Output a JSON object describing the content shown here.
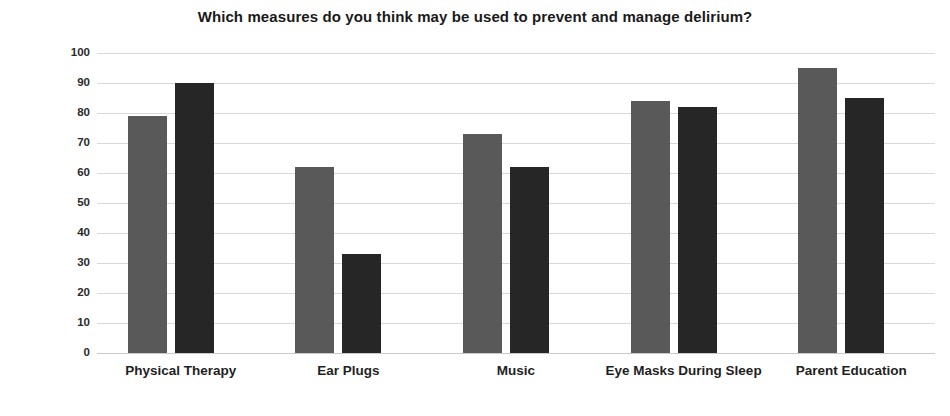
{
  "chart_data": {
    "type": "bar",
    "title": "Which measures do you think may be used to prevent and manage delirium?",
    "xlabel": "",
    "ylabel": "",
    "ylim": [
      0,
      100
    ],
    "ytick_step": 10,
    "yticks": [
      100,
      90,
      80,
      70,
      60,
      50,
      40,
      30,
      20,
      10,
      0
    ],
    "grid": true,
    "legend": "none",
    "categories": [
      "Physical Therapy",
      "Ear Plugs",
      "Music",
      "Eye Masks During Sleep",
      "Parent Education"
    ],
    "series": [
      {
        "name": "series-a",
        "color": "#595959",
        "values": [
          79,
          62,
          73,
          84,
          95
        ]
      },
      {
        "name": "series-b",
        "color": "#262626",
        "values": [
          90,
          33,
          62,
          82,
          85
        ]
      }
    ]
  },
  "colors": {
    "series_a": "#595959",
    "series_b": "#262626",
    "gridline": "#d9d9d9",
    "text": "#1f1f1f",
    "background": "#ffffff"
  }
}
